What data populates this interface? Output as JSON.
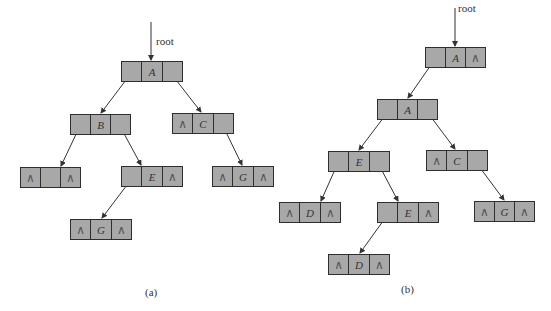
{
  "colors": {
    "node_fill": "#a8a8a8",
    "node_border": "#2e2e2e",
    "edge": "#333333"
  },
  "null_symbol": "∧",
  "root_label": "root",
  "figures": [
    {
      "caption": "(a)",
      "nodes": [
        {
          "id": "a-A",
          "left": "",
          "data": "A",
          "right": ""
        },
        {
          "id": "a-B",
          "left": "",
          "data": "B",
          "right": ""
        },
        {
          "id": "a-C",
          "left": "∧",
          "data": "C",
          "right": ""
        },
        {
          "id": "a-L",
          "left": "∧",
          "data": "",
          "right": "∧"
        },
        {
          "id": "a-E",
          "left": "",
          "data": "E",
          "right": "∧"
        },
        {
          "id": "a-G1",
          "left": "∧",
          "data": "G",
          "right": "∧"
        },
        {
          "id": "a-G2",
          "left": "∧",
          "data": "G",
          "right": "∧"
        }
      ]
    },
    {
      "caption": "(b)",
      "nodes": [
        {
          "id": "b-R",
          "left": "",
          "data": "A",
          "right": "∧"
        },
        {
          "id": "b-A",
          "left": "",
          "data": "A",
          "right": ""
        },
        {
          "id": "b-E1",
          "left": "",
          "data": "E",
          "right": ""
        },
        {
          "id": "b-C",
          "left": "∧",
          "data": "C",
          "right": ""
        },
        {
          "id": "b-D1",
          "left": "∧",
          "data": "D",
          "right": "∧"
        },
        {
          "id": "b-E2",
          "left": "",
          "data": "E",
          "right": "∧"
        },
        {
          "id": "b-G",
          "left": "∧",
          "data": "G",
          "right": "∧"
        },
        {
          "id": "b-D2",
          "left": "∧",
          "data": "D",
          "right": "∧"
        }
      ]
    }
  ]
}
